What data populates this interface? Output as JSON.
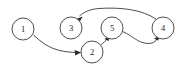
{
  "figure": {
    "type": "directed-graph",
    "background_color": "#ffffff",
    "stroke_color": "#3b3b3b",
    "label_color": "#1a1a1a",
    "width": 185,
    "height": 71
  },
  "graph_data": {
    "type": "diagram",
    "directed": true,
    "node_radius": 11,
    "nodes": [
      {
        "id": "1",
        "label": "1",
        "x": 23,
        "y": 29
      },
      {
        "id": "3",
        "label": "3",
        "x": 71,
        "y": 28
      },
      {
        "id": "5",
        "label": "5",
        "x": 112,
        "y": 28
      },
      {
        "id": "4",
        "label": "4",
        "x": 163,
        "y": 28
      },
      {
        "id": "2",
        "label": "2",
        "x": 92,
        "y": 52
      }
    ],
    "edges": [
      {
        "from": "1",
        "to": "2",
        "label": ""
      },
      {
        "from": "2",
        "to": "5",
        "label": ""
      },
      {
        "from": "5",
        "to": "4",
        "label": ""
      },
      {
        "from": "4",
        "to": "3",
        "label": ""
      }
    ]
  }
}
